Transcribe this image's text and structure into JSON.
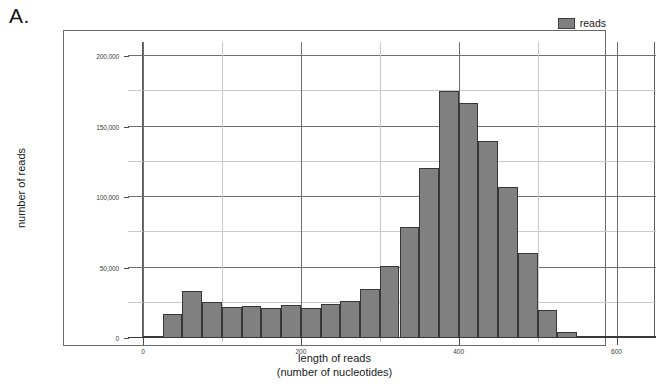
{
  "figure": {
    "panel_label": "A."
  },
  "legend": {
    "position": "top-right",
    "entries": [
      {
        "label": "reads",
        "color": "#808080"
      }
    ]
  },
  "axes": {
    "y": {
      "title": "number of reads",
      "major_ticks": [
        "0",
        "50,000",
        "100,000",
        "150,000",
        "200,000"
      ],
      "major_values": [
        0,
        50000,
        100000,
        150000,
        200000
      ],
      "minor_values": [
        25000,
        75000,
        125000,
        175000
      ],
      "limit_min": 0,
      "limit_max": 210000
    },
    "x": {
      "title_line1": "length of reads",
      "title_line2": "(number of nucleotides)",
      "major_ticks": [
        "0",
        "200",
        "400",
        "600"
      ],
      "major_values": [
        0,
        200,
        400,
        600
      ],
      "minor_values": [
        100,
        300,
        500
      ],
      "limit_min": 0,
      "limit_max": 650
    }
  },
  "chart_data": {
    "type": "bar",
    "title": "A.",
    "xlabel": "length of reads (number of nucleotides)",
    "ylabel": "number of reads",
    "xlim": [
      0,
      650
    ],
    "ylim": [
      0,
      210000
    ],
    "grid": true,
    "legend_position": "top-right",
    "bin_width": 25,
    "series": [
      {
        "name": "reads",
        "color": "#808080",
        "bin_starts": [
          0,
          25,
          50,
          75,
          100,
          125,
          150,
          175,
          200,
          225,
          250,
          275,
          300,
          325,
          350,
          375,
          400,
          425,
          450,
          475,
          500,
          525,
          550,
          575,
          600,
          625
        ],
        "values": [
          400,
          17000,
          33500,
          25500,
          22000,
          22500,
          21500,
          23500,
          21000,
          24000,
          26500,
          34500,
          51000,
          79000,
          120500,
          175000,
          167000,
          140000,
          107000,
          60000,
          20000,
          4000,
          700,
          400,
          300,
          200
        ]
      }
    ],
    "annotations": {
      "peak_bin": "375-400",
      "peak_value": 175000
    }
  }
}
